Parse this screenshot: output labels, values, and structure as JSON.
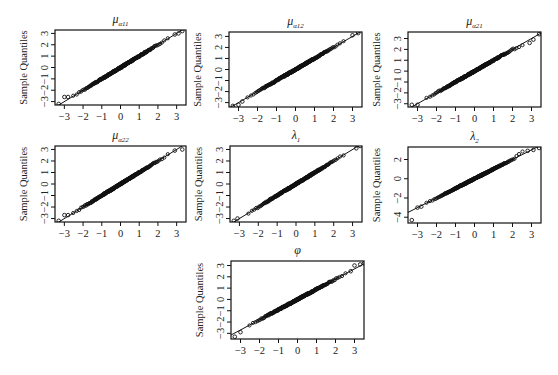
{
  "figure": {
    "type": "qq-grid",
    "ylabel_common": "Sample Quantiles"
  },
  "chart_data": [
    {
      "type": "scatter",
      "id": "mu_a11",
      "title_main": "μ",
      "title_sub": "α11",
      "title": "μ_α11",
      "xlabel": "",
      "ylabel": "Sample Quantiles",
      "xticks": [
        -3,
        -2,
        -1,
        0,
        1,
        2,
        3
      ],
      "yticks": [
        -3,
        -2,
        -1,
        0,
        1,
        2,
        3
      ],
      "xlim": [
        -3.5,
        3.5
      ],
      "ylim": [
        -3.3,
        3.3
      ],
      "reference_line": {
        "slope": 1.0,
        "intercept": 0.0
      },
      "shape": "near-normal; flat step near (-3,-2.6); slight upper bulge near 2.5-3",
      "outliers": [
        [
          -3.3,
          -3.2
        ],
        [
          -3.0,
          -2.6
        ],
        [
          -2.8,
          -2.6
        ],
        [
          2.9,
          2.9
        ],
        [
          3.1,
          3.0
        ],
        [
          3.3,
          3.2
        ]
      ],
      "box": {
        "x": 55,
        "y": 30,
        "w": 131,
        "h": 75
      }
    },
    {
      "type": "scatter",
      "id": "mu_a12",
      "title_main": "μ",
      "title_sub": "α12",
      "title": "μ_α12",
      "xlabel": "",
      "ylabel": "Sample Quantiles",
      "xticks": [
        -3,
        -2,
        -1,
        0,
        1,
        2,
        3
      ],
      "yticks": [
        -3,
        -2,
        -1,
        0,
        1,
        2,
        3
      ],
      "xlim": [
        -3.5,
        3.5
      ],
      "ylim": [
        -3.4,
        3.4
      ],
      "reference_line": {
        "slope": 1.0,
        "intercept": 0.0
      },
      "shape": "near-normal with light tails",
      "outliers": [
        [
          -3.3,
          -3.3
        ],
        [
          -3.0,
          -3.2
        ],
        [
          -2.8,
          -2.9
        ],
        [
          3.0,
          3.1
        ],
        [
          3.3,
          3.3
        ]
      ],
      "box": {
        "x": 229,
        "y": 32,
        "w": 133,
        "h": 75
      }
    },
    {
      "type": "scatter",
      "id": "mu_a21",
      "title_main": "μ",
      "title_sub": "α21",
      "title": "μ_α21",
      "xlabel": "",
      "ylabel": "Sample Quantiles",
      "xticks": [
        -3,
        -2,
        -1,
        0,
        1,
        2,
        3
      ],
      "yticks": [
        -3,
        -2,
        -1,
        0,
        1,
        2,
        3
      ],
      "xlim": [
        -3.5,
        3.5
      ],
      "ylim": [
        -3.3,
        3.6
      ],
      "reference_line": {
        "slope": 1.0,
        "intercept": 0.0
      },
      "shape": "near-normal; mild kink around x=2.3-2.8",
      "outliers": [
        [
          -3.3,
          -3.1
        ],
        [
          -3.0,
          -3.1
        ],
        [
          2.9,
          2.6
        ],
        [
          3.1,
          2.9
        ],
        [
          3.4,
          3.4
        ]
      ],
      "box": {
        "x": 408,
        "y": 32,
        "w": 133,
        "h": 75
      }
    },
    {
      "type": "scatter",
      "id": "mu_a22",
      "title_main": "μ",
      "title_sub": "α22",
      "title": "μ_α22",
      "xlabel": "",
      "ylabel": "Sample Quantiles",
      "xticks": [
        -3,
        -2,
        -1,
        0,
        1,
        2,
        3
      ],
      "yticks": [
        -3,
        -2,
        -1,
        0,
        1,
        2,
        3
      ],
      "xlim": [
        -3.5,
        3.5
      ],
      "ylim": [
        -3.3,
        3.3
      ],
      "reference_line": {
        "slope": 1.0,
        "intercept": 0.0
      },
      "shape": "near-normal; step near (-3,-2.7)",
      "outliers": [
        [
          -3.3,
          -3.2
        ],
        [
          -3.0,
          -2.7
        ],
        [
          -2.8,
          -2.7
        ],
        [
          2.9,
          2.9
        ],
        [
          3.3,
          3.0
        ]
      ],
      "box": {
        "x": 55,
        "y": 146,
        "w": 131,
        "h": 76
      }
    },
    {
      "type": "scatter",
      "id": "lambda_1",
      "title_main": "λ",
      "title_sub": "1",
      "title": "λ_1",
      "xlabel": "",
      "ylabel": "Sample Quantiles",
      "xticks": [
        -3,
        -2,
        -1,
        0,
        1,
        2,
        3
      ],
      "yticks": [
        -3,
        -2,
        -1,
        0,
        1,
        2,
        3
      ],
      "xlim": [
        -3.5,
        3.5
      ],
      "ylim": [
        -3.3,
        3.3
      ],
      "reference_line": {
        "slope": 1.0,
        "intercept": 0.0
      },
      "shape": "very close to normal line",
      "outliers": [
        [
          -3.3,
          -3.2
        ],
        [
          -3.1,
          -3.0
        ],
        [
          3.2,
          3.1
        ],
        [
          3.4,
          3.3
        ]
      ],
      "box": {
        "x": 230,
        "y": 146,
        "w": 132,
        "h": 76
      }
    },
    {
      "type": "scatter",
      "id": "lambda_2",
      "title_main": "λ",
      "title_sub": "2",
      "title": "λ_2",
      "xlabel": "",
      "ylabel": "Sample Quantiles",
      "xticks": [
        -3,
        -2,
        -1,
        0,
        1,
        2,
        3
      ],
      "yticks": [
        -4,
        -2,
        0,
        2
      ],
      "xlim": [
        -3.5,
        3.5
      ],
      "ylim": [
        -4.6,
        3.3
      ],
      "reference_line": {
        "slope": 1.0,
        "intercept": 0.0
      },
      "shape": "near-normal; upper tail bulge at x 2.2-2.8; one low outlier",
      "outliers": [
        [
          -3.3,
          -4.3
        ],
        [
          -3.0,
          -3.0
        ],
        [
          -2.8,
          -2.9
        ],
        [
          2.8,
          2.9
        ],
        [
          3.1,
          3.0
        ],
        [
          3.4,
          3.2
        ]
      ],
      "box": {
        "x": 408,
        "y": 147,
        "w": 133,
        "h": 76
      }
    },
    {
      "type": "scatter",
      "id": "phi",
      "title_main": "φ",
      "title_sub": "",
      "title": "φ",
      "xlabel": "",
      "ylabel": "Sample Quantiles",
      "xticks": [
        -3,
        -2,
        -1,
        0,
        1,
        2,
        3
      ],
      "yticks": [
        -3,
        -2,
        -1,
        0,
        1,
        2,
        3
      ],
      "xlim": [
        -3.5,
        3.5
      ],
      "ylim": [
        -3.5,
        3.4
      ],
      "reference_line": {
        "slope": 0.9,
        "intercept": 0.0
      },
      "shape": "near-normal; heavier tails at both ends",
      "outliers": [
        [
          -3.3,
          -3.3
        ],
        [
          -3.0,
          -2.9
        ],
        [
          2.8,
          2.5
        ],
        [
          3.0,
          3.0
        ],
        [
          3.3,
          3.1
        ],
        [
          3.5,
          3.2
        ]
      ],
      "box": {
        "x": 231,
        "y": 261,
        "w": 133,
        "h": 78
      }
    }
  ]
}
